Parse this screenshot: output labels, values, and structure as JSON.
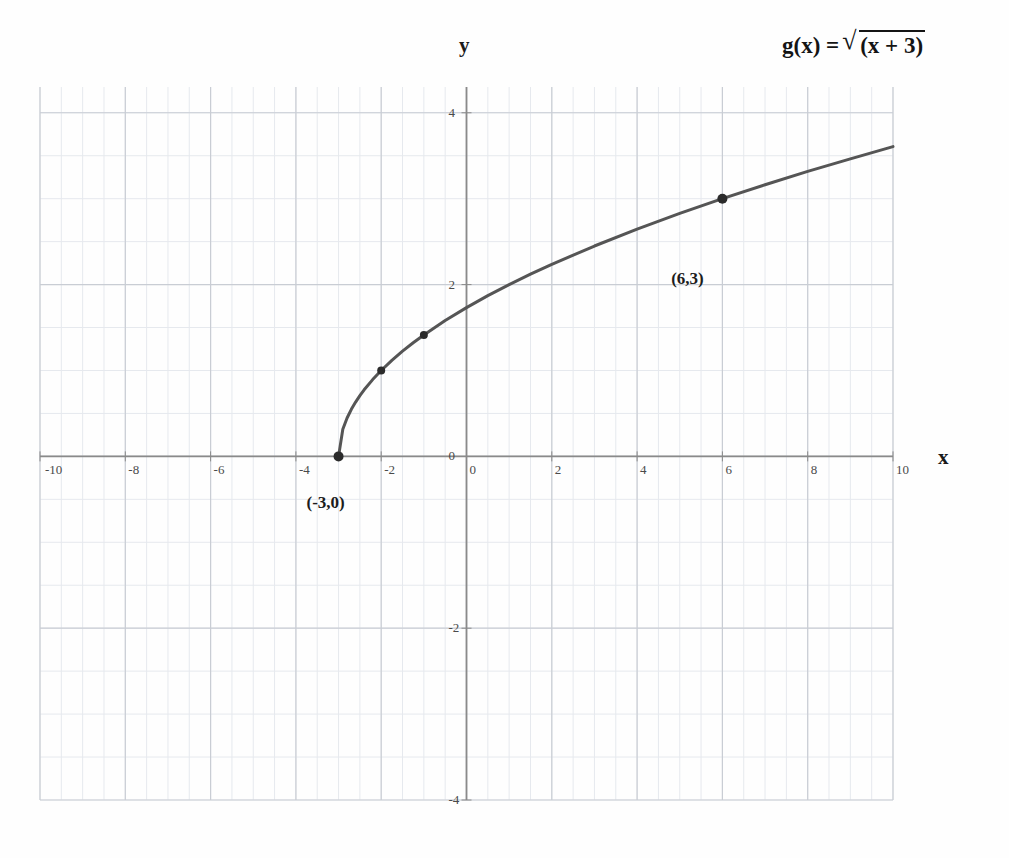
{
  "equation": {
    "lhs": "g(x) =",
    "radical_glyph": "√",
    "radicand": "(x + 3)",
    "full_text": "g(x) = √(x + 3)"
  },
  "axes": {
    "x_name": "x",
    "y_name": "y"
  },
  "chart_data": {
    "type": "line",
    "xlabel": "x",
    "ylabel": "y",
    "xlim": [
      -10,
      10
    ],
    "ylim": [
      -4,
      4.3
    ],
    "grid": true,
    "grid_major_step": 2,
    "grid_minor_step": 0.5,
    "legend": "none",
    "x_ticks": [
      {
        "value": -10,
        "label": "-10"
      },
      {
        "value": -8,
        "label": "-8"
      },
      {
        "value": -6,
        "label": "-6"
      },
      {
        "value": -4,
        "label": "-4"
      },
      {
        "value": -2,
        "label": "-2"
      },
      {
        "value": 0,
        "label": "0"
      },
      {
        "value": 2,
        "label": "2"
      },
      {
        "value": 4,
        "label": "4"
      },
      {
        "value": 6,
        "label": "6"
      },
      {
        "value": 8,
        "label": "8"
      },
      {
        "value": 10,
        "label": "10"
      }
    ],
    "y_ticks": [
      {
        "value": 4,
        "label": "4"
      },
      {
        "value": 2,
        "label": "2"
      },
      {
        "value": 0,
        "label": "0"
      },
      {
        "value": -2,
        "label": "-2"
      },
      {
        "value": -4,
        "label": "-4"
      }
    ],
    "series": [
      {
        "name": "g(x) = √(x + 3)",
        "domain": [
          -3,
          10
        ],
        "x": [
          -3,
          -2.9,
          -2.8,
          -2.7,
          -2.6,
          -2.5,
          -2.4,
          -2.2,
          -2,
          -1.75,
          -1.5,
          -1.25,
          -1,
          -0.5,
          0,
          0.5,
          1,
          1.5,
          2,
          3,
          4,
          5,
          6,
          7,
          8,
          9,
          10
        ],
        "y": [
          0,
          0.316,
          0.447,
          0.548,
          0.632,
          0.707,
          0.775,
          0.894,
          1,
          1.118,
          1.225,
          1.323,
          1.414,
          1.581,
          1.732,
          1.871,
          2,
          2.121,
          2.236,
          2.449,
          2.646,
          2.828,
          3,
          3.162,
          3.317,
          3.464,
          3.606
        ]
      }
    ],
    "marked_points": [
      {
        "x": -3,
        "y": 0,
        "label": "(-3,0)",
        "label_shown": true
      },
      {
        "x": -2,
        "y": 1,
        "label": "(-2,1)",
        "label_shown": false
      },
      {
        "x": -1,
        "y": 1.414,
        "label": "(-1,1.41)",
        "label_shown": false
      },
      {
        "x": 6,
        "y": 3,
        "label": "(6,3)",
        "label_shown": true
      }
    ],
    "annotations": [
      {
        "text": "(-3,0)",
        "x": -3,
        "y": -0.55
      },
      {
        "text": "(6,3)",
        "x": 5.55,
        "y": 2.05
      }
    ],
    "colors": {
      "curve": "#555555",
      "point": "#2b2b2b",
      "axis": "#888888",
      "grid_major": "#c9cdd4",
      "grid_minor": "#e6e9ee",
      "background": "#fefefe",
      "text": "#1a1a1a"
    }
  }
}
